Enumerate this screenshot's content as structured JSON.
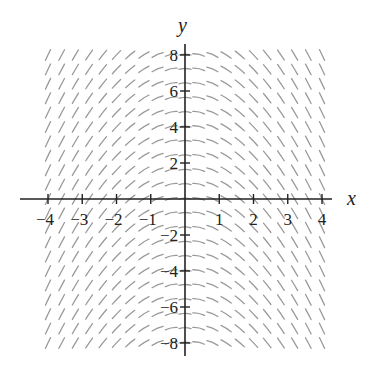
{
  "chart_data": {
    "type": "slope_field",
    "title": "",
    "xlabel": "x",
    "ylabel": "y",
    "differential_equation": "dy/dx = -x",
    "xlim": [
      -4,
      4
    ],
    "ylim": [
      -8,
      8
    ],
    "x_ticks": [
      -4,
      -3,
      -2,
      -1,
      1,
      2,
      3,
      4
    ],
    "x_tick_labels": [
      "-4",
      "-3",
      "-2",
      "-1",
      "1",
      "2",
      "3",
      "4"
    ],
    "y_ticks": [
      -8,
      -6,
      -4,
      -2,
      2,
      4,
      6,
      8
    ],
    "y_tick_labels": [
      "-8",
      "-6",
      "-4",
      "-2",
      "2",
      "4",
      "6",
      "8"
    ],
    "grid": false,
    "legend": null,
    "field_grid": {
      "x_start": -4,
      "x_end": 4,
      "x_step": 0.4,
      "y_start": -8,
      "y_end": 8,
      "y_step": 0.8
    },
    "segment_length_px": 12,
    "segment_color": "#9a9a9a",
    "axis_color": "#222222"
  },
  "layout": {
    "origin_px": [
      185,
      199
    ],
    "x_unit_px": 34.25,
    "y_unit_px": 18,
    "x_axis_px": [
      20,
      332
    ],
    "y_axis_px": [
      44,
      356
    ],
    "xlabel_pos": [
      347,
      205
    ],
    "ylabel_pos": [
      178,
      32
    ]
  }
}
